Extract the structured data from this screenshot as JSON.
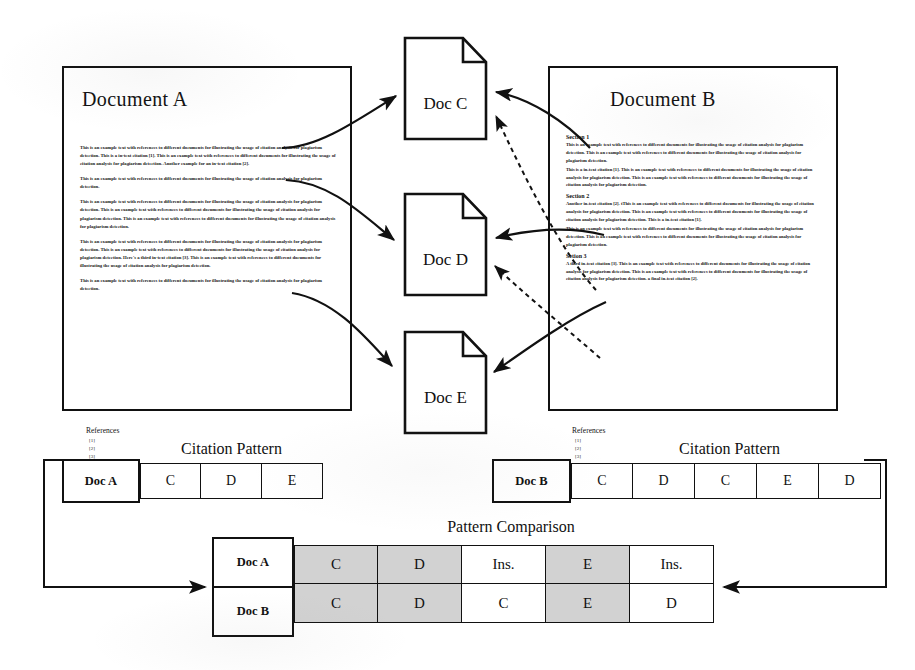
{
  "documents": {
    "doc_a": {
      "title": "Document A",
      "paragraphs": [
        "This is an example text with references to different documents for illustrating the usage of citation analysis for plagiarism detection. This is a in-text citation [1]. This is an example text with references to different documents for illustrating the usage of citation analysis for plagiarism detection. Another example for an in-text citation [2].",
        "This is an example text with references to different documents for illustrating the usage of citation analysis for plagiarism detection.",
        "This is an example text with references to different documents for illustrating the usage of citation analysis for plagiarism detection. This is an example text with references to different documents for illustrating the usage of citation analysis for plagiarism detection. This is an example text with references to different documents for illustrating the usage of citation analysis for plagiarism detection.",
        "This is an example text with references to different documents for illustrating the usage of citation analysis for plagiarism detection. This is an example text with references to different documents for illustrating the usage of citation analysis for plagiarism detection. Here's a third in-text citation [3]. This is an example text with references to different documents for illustrating the usage of citation analysis for plagiarism detection.",
        "This is an example text with references to different documents for illustrating the usage of citation analysis for plagiarism detection."
      ],
      "references_title": "References",
      "references": [
        "[1]",
        "[2]",
        "[3]"
      ]
    },
    "doc_b": {
      "title": "Document B",
      "sections": [
        {
          "heading": "Section 1",
          "paragraphs": [
            "This is an example text with references to different documents for illustrating the usage of citation analysis for plagiarism detection. This is an example text with references to different documents for illustrating the usage of citation analysis for plagiarism detection.",
            "This is a in-text citation [1]. This is an example text with references to different documents for illustrating the usage of citation analysis for plagiarism detection. This is an example text with references to different documents for illustrating the usage of citation analysis for plagiarism detection."
          ]
        },
        {
          "heading": "Section 2",
          "paragraphs": [
            "Another in-text citation [2]. tThis is an example text with references to different documents for illustrating the usage of citation analysis for plagiarism detection. This is an example text with references to different documents for illustrating the usage of citation analysis for plagiarism detection. This is a in-text citation [1].",
            "This is an example text with references to different documents for illustrating the usage of citation analysis for plagiarism detection. This is an example text with references to different documents for illustrating the usage of citation analysis for plagiarism detection."
          ]
        },
        {
          "heading": "Setion 3",
          "paragraphs": [
            "A third in-text citation [3]. This is an example text with references to different documents for illustrating the usage of citation analysis for plagiarism detection. This is an example text with references to different documents for illustrating the usage of citation analysis for plagiarism detection. a final in-text citation [2]."
          ]
        }
      ],
      "references_title": "References",
      "references": [
        "[1]",
        "[2]",
        "[3]"
      ]
    }
  },
  "cited_documents": [
    {
      "label": "Doc C"
    },
    {
      "label": "Doc D"
    },
    {
      "label": "Doc E"
    }
  ],
  "citation_pattern_a": {
    "title": "Citation Pattern",
    "doc_label": "Doc A",
    "cells": [
      "C",
      "D",
      "E"
    ]
  },
  "citation_pattern_b": {
    "title": "Citation Pattern",
    "doc_label": "Doc B",
    "cells": [
      "C",
      "D",
      "C",
      "E",
      "D"
    ]
  },
  "pattern_comparison": {
    "title": "Pattern Comparison",
    "row_a_label": "Doc A",
    "row_b_label": "Doc B",
    "row_a": [
      "C",
      "D",
      "Ins.",
      "E",
      "Ins."
    ],
    "row_b": [
      "C",
      "D",
      "C",
      "E",
      "D"
    ],
    "match_flags": [
      true,
      true,
      false,
      true,
      false
    ]
  },
  "colors": {
    "ink": "#111111",
    "match_shade": "#d2d2d2",
    "paper": "#ffffff"
  }
}
